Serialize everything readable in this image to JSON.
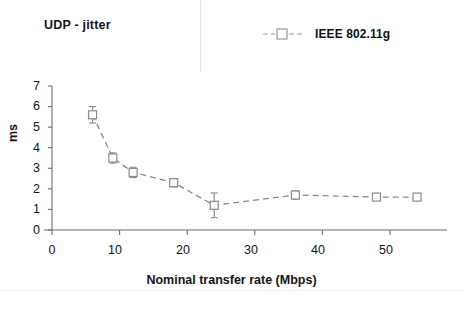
{
  "chart_data": {
    "type": "line",
    "title": "UDP - jitter",
    "xlabel": "Nominal transfer rate (Mbps)",
    "ylabel": "ms",
    "xlim": [
      0,
      55
    ],
    "ylim": [
      0,
      7
    ],
    "grid": false,
    "legend_position": "top-right",
    "xticks": [
      "0",
      "10",
      "20",
      "30",
      "40",
      "50"
    ],
    "xtick_values": [
      0,
      10,
      20,
      30,
      40,
      50
    ],
    "yticks": [
      "0",
      "1",
      "2",
      "3",
      "4",
      "5",
      "6",
      "7"
    ],
    "ytick_values": [
      0,
      1,
      2,
      3,
      4,
      5,
      6,
      7
    ],
    "series": [
      {
        "name": "IEEE 802.11g",
        "marker": "open-square",
        "linestyle": "dashed",
        "color": "#8a8a8a",
        "x": [
          6,
          9,
          12,
          18,
          24,
          36,
          48,
          54
        ],
        "values": [
          5.6,
          3.5,
          2.8,
          2.3,
          1.2,
          1.7,
          1.6,
          1.6
        ],
        "error": [
          0.4,
          0.25,
          0.25,
          0.2,
          0.6,
          0.2,
          0.12,
          0.15
        ]
      }
    ]
  },
  "figure": {
    "title": "UDP - jitter",
    "legend": {
      "label": "IEEE 802.11g"
    },
    "axes": {
      "y_title": "ms",
      "x_title": "Nominal transfer rate (Mbps)"
    },
    "caption": ""
  }
}
